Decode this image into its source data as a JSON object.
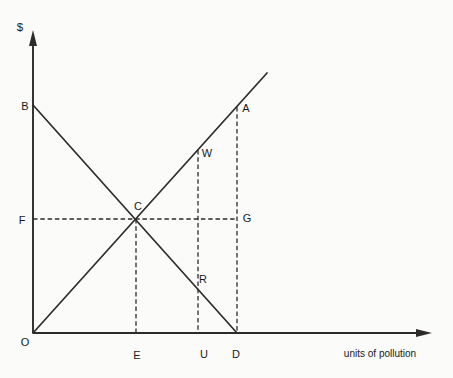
{
  "page": {
    "background": "#fbfbf9"
  },
  "figure": {
    "canvas": {
      "width": 453,
      "height": 378
    },
    "colors": {
      "ink": "#2e2c2a",
      "text": "#1a1a1a",
      "background": "#fbfbf9"
    },
    "y_axis": {
      "label": "$",
      "x": 33,
      "tip_y": 30,
      "base_y": 333,
      "label_cx": 20,
      "label_cy": 27
    },
    "x_axis": {
      "label": "units of pollution",
      "y": 333,
      "left_x": 33,
      "tip_x": 432,
      "label_cx": 380,
      "label_cy": 353
    },
    "curves": [
      {
        "name": "rising-cost-line",
        "x1": 33,
        "y1": 333,
        "x2": 267,
        "y2": 73
      },
      {
        "name": "falling-benefit-line",
        "x1": 33,
        "y1": 105,
        "x2": 237,
        "y2": 333
      }
    ],
    "guides": [
      {
        "name": "guide-vertical-e",
        "x1": 136,
        "y1": 219,
        "x2": 136,
        "y2": 333
      },
      {
        "name": "guide-vertical-u",
        "x1": 198,
        "y1": 150,
        "x2": 198,
        "y2": 333
      },
      {
        "name": "guide-vertical-d",
        "x1": 237,
        "y1": 107,
        "x2": 237,
        "y2": 333
      },
      {
        "name": "guide-horizontal-f-g",
        "x1": 33,
        "y1": 219,
        "x2": 237,
        "y2": 219
      }
    ],
    "points": [
      {
        "label": "B",
        "cx": 25,
        "cy": 106
      },
      {
        "label": "F",
        "cx": 22,
        "cy": 220
      },
      {
        "label": "O",
        "cx": 25,
        "cy": 342
      },
      {
        "label": "C",
        "cx": 138,
        "cy": 206
      },
      {
        "label": "W",
        "cx": 207,
        "cy": 153
      },
      {
        "label": "R",
        "cx": 203,
        "cy": 279
      },
      {
        "label": "A",
        "cx": 246,
        "cy": 108
      },
      {
        "label": "G",
        "cx": 247,
        "cy": 218
      },
      {
        "label": "E",
        "cx": 137,
        "cy": 355
      },
      {
        "label": "U",
        "cx": 204,
        "cy": 354
      },
      {
        "label": "D",
        "cx": 236,
        "cy": 354
      }
    ]
  }
}
